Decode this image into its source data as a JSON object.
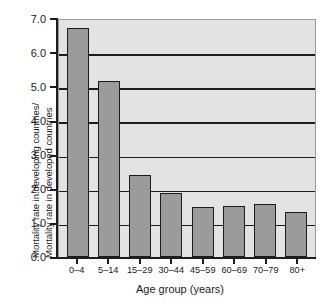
{
  "chart_data": {
    "type": "bar",
    "title": "",
    "categories": [
      "0–4",
      "5–14",
      "15–29",
      "30–44",
      "45–59",
      "60–69",
      "70–79",
      "80+"
    ],
    "values": [
      6.75,
      5.2,
      2.43,
      1.9,
      1.48,
      1.52,
      1.56,
      1.33
    ],
    "xlabel": "Age group (years)",
    "ylabel_line1": "Mortality rate in developing countries/",
    "ylabel_line2": "Mortality rate in developed countries",
    "ylim": [
      0.0,
      7.0
    ],
    "yticks": [
      "7.0",
      "6.0",
      "5.0",
      "4.0",
      "3.0",
      "2.0",
      "1.0",
      "0.0"
    ],
    "ytick_values": [
      7.0,
      6.0,
      5.0,
      4.0,
      3.0,
      2.0,
      1.0,
      0.0
    ],
    "gridlines": [
      6.0,
      5.0,
      4.0,
      3.0,
      2.0,
      1.0
    ],
    "grid": true,
    "legend": "none",
    "colors": {
      "bar_fill": "#9b9b9b",
      "bar_edge": "#1c1c1c",
      "plot_background": "#e3e3e3",
      "axis": "#1c1c1c",
      "text": "#1a1a1a"
    }
  }
}
